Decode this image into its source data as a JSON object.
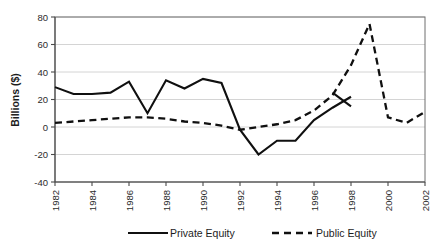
{
  "chart_data": {
    "type": "line",
    "title": "",
    "xlabel": "",
    "ylabel": "Billions ($)",
    "x": [
      1982,
      1983,
      1984,
      1985,
      1986,
      1987,
      1988,
      1989,
      1990,
      1991,
      1992,
      1993,
      1994,
      1995,
      1996,
      1997,
      1998,
      1999,
      2000,
      2001,
      2002
    ],
    "xtick_labels": [
      "1982",
      "1984",
      "1986",
      "1988",
      "1990",
      "1992",
      "1994",
      "1996",
      "1998",
      "2000",
      "2002"
    ],
    "xtick_values": [
      1982,
      1984,
      1986,
      1988,
      1990,
      1992,
      1994,
      1996,
      1998,
      2000,
      2002
    ],
    "xlim": [
      1982,
      2002
    ],
    "ylim": [
      -40,
      80
    ],
    "ytick_labels": [
      "80",
      "60",
      "40",
      "20",
      "0",
      "-20",
      "-40"
    ],
    "ytick_values": [
      80,
      60,
      40,
      20,
      0,
      -20,
      -40
    ],
    "grid": true,
    "grid_axis": "y",
    "legend_position": "bottom",
    "series": [
      {
        "name": "Private Equity",
        "style": "solid",
        "color": "#101010",
        "x": [
          1982,
          1983,
          1984,
          1985,
          1986,
          1987,
          1988,
          1989,
          1990,
          1991,
          1992,
          1993,
          1994,
          1995,
          1996,
          1997,
          1998
        ],
        "values": [
          29,
          24,
          24,
          25,
          33,
          10,
          34,
          28,
          35,
          32,
          -2,
          -20,
          -10,
          -10,
          5,
          14,
          22
        ]
      },
      {
        "name": "Public Equity",
        "style": "dashed",
        "color": "#101010",
        "x": [
          1982,
          1983,
          1984,
          1985,
          1986,
          1987,
          1988,
          1989,
          1990,
          1991,
          1992,
          1993,
          1994,
          1995,
          1996,
          1997,
          1998,
          1999,
          2000,
          2001,
          2002
        ],
        "values": [
          3,
          4,
          5,
          6,
          7,
          7,
          6,
          4,
          3,
          1,
          -2,
          0,
          2,
          5,
          12,
          23,
          45,
          75,
          7,
          3,
          11
        ]
      }
    ],
    "extra_segments": [
      {
        "series": "Private Equity",
        "note": "tail segment after 1997 peak descending to 1998",
        "x": [
          1997,
          1998
        ],
        "values": [
          25,
          15
        ]
      }
    ]
  },
  "axis": {
    "ylabel": "Billions ($)"
  },
  "legend": {
    "entries": [
      {
        "label": "Private Equity",
        "icon": "solid-line-swatch"
      },
      {
        "label": "Public Equity",
        "icon": "dashed-line-swatch"
      }
    ]
  }
}
